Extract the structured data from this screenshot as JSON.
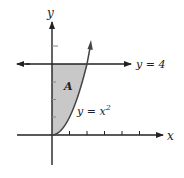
{
  "figure": {
    "y_axis_label": "y",
    "x_axis_label": "x",
    "line_label": "y = 4",
    "curve_label_base": "y = x",
    "curve_label_exp": "2",
    "region_label": "A",
    "colors": {
      "stroke": "#222222",
      "fill": "#c8c8c8"
    }
  }
}
